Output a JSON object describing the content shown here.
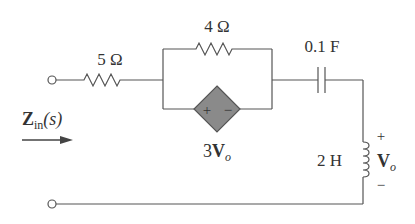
{
  "diagram": {
    "type": "circuit",
    "components": {
      "r1": {
        "label": "5 Ω",
        "kind": "resistor"
      },
      "r2": {
        "label": "4 Ω",
        "kind": "resistor"
      },
      "c1": {
        "label": "0.1 F",
        "kind": "capacitor"
      },
      "l1": {
        "label": "2 H",
        "kind": "inductor"
      },
      "dep_source": {
        "label_coef": "3",
        "label_var": "V",
        "label_sub": "o",
        "kind": "dependent-voltage-source",
        "plus": "+",
        "minus": "−"
      }
    },
    "vo": {
      "var": "V",
      "sub": "o",
      "plus": "+",
      "minus": "−"
    },
    "zin": {
      "var": "Z",
      "sub": "in",
      "arg": "(s)"
    },
    "colors": {
      "wire": "#555555",
      "source_fill": "#8a8a8a",
      "text": "#333333"
    }
  }
}
